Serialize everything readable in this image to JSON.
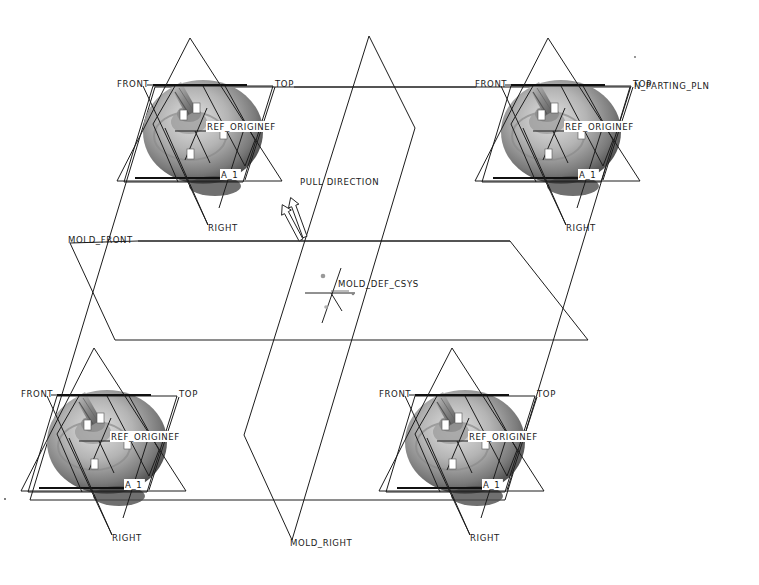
{
  "view": {
    "background": "#ffffff",
    "line_color": "#1c1c1c",
    "part_colors": {
      "light": "#d8d8d8",
      "mid": "#a6a6a6",
      "dark": "#5a5a5a",
      "shadow": "#3e3e3e"
    }
  },
  "assembly_datums": {
    "parting_plane": {
      "label": "MAIN_PARTING_PLN",
      "visible_label": "N_PARTING_PLN",
      "points": [
        [
          155,
          87
        ],
        [
          630,
          87
        ],
        [
          505,
          500
        ],
        [
          30,
          500
        ]
      ],
      "label_pos": [
        634,
        89
      ]
    },
    "mold_front": {
      "label": "MOLD_FRONT",
      "label_pos": [
        68,
        243
      ],
      "points": [
        [
          138,
          241
        ],
        [
          510,
          241
        ],
        [
          588,
          340
        ],
        [
          115,
          340
        ],
        [
          70,
          243
        ]
      ]
    },
    "mold_right": {
      "label": "MOLD_RIGHT",
      "label_pos": [
        290,
        546
      ],
      "segments": [
        [
          [
            369,
            36
          ],
          [
            415,
            128
          ]
        ],
        [
          [
            415,
            128
          ],
          [
            292,
            540
          ]
        ],
        [
          [
            369,
            36
          ],
          [
            244,
            435
          ]
        ],
        [
          [
            244,
            435
          ],
          [
            292,
            540
          ]
        ]
      ]
    },
    "pull_direction": {
      "label": "PULL DIRECTION",
      "label_pos": [
        300,
        185
      ],
      "origin": [
        304,
        240
      ]
    },
    "csys": {
      "label": "MOLD_DEF_CSYS",
      "label_pos": [
        338,
        287
      ],
      "origin": [
        331,
        293
      ]
    }
  },
  "cavities": [
    {
      "id": "top-left",
      "center": [
        195,
        128
      ],
      "labels": {
        "front": "FRONT",
        "top": "TOP",
        "ref_origin": "REF_ORIGINEF",
        "axis": "A_1",
        "right": "RIGHT"
      }
    },
    {
      "id": "top-right",
      "center": [
        553,
        128
      ],
      "labels": {
        "front": "FRONT",
        "top": "TOP",
        "ref_origin": "REF_ORIGINEF",
        "axis": "A_1",
        "right": "RIGHT"
      }
    },
    {
      "id": "bottom-left",
      "center": [
        99,
        438
      ],
      "labels": {
        "front": "FRONT",
        "top": "TOP",
        "ref_origin": "REF_ORIGINEF",
        "axis": "A_1",
        "right": "RIGHT"
      }
    },
    {
      "id": "bottom-right",
      "center": [
        457,
        438
      ],
      "labels": {
        "front": "FRONT",
        "top": "TOP",
        "ref_origin": "REF_ORIGINEF",
        "axis": "A_1",
        "right": "RIGHT"
      }
    }
  ],
  "axis_tags": [
    "X",
    "Y",
    "Z"
  ]
}
